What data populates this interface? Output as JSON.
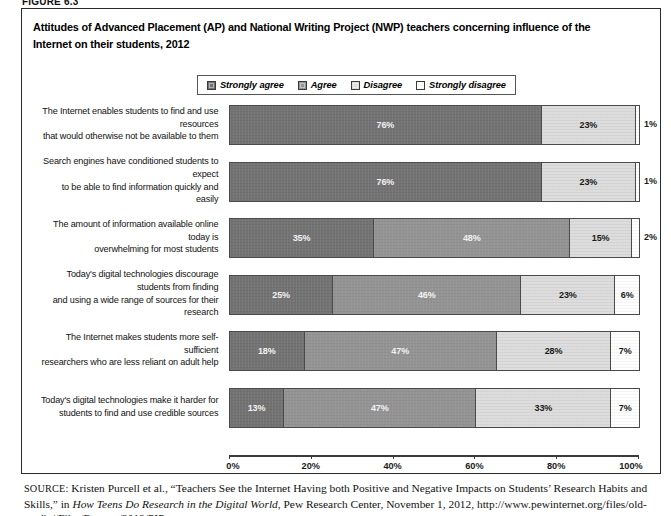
{
  "figure_label": "FIGURE 6.3",
  "title": "Attitudes of Advanced Placement (AP) and National Writing Project (NWP) teachers concerning influence of the Internet on their students, 2012",
  "legend": {
    "items": [
      {
        "label": "Strongly agree",
        "color": "#737373",
        "key": "strongly_agree"
      },
      {
        "label": "Agree",
        "color": "#949494",
        "key": "agree"
      },
      {
        "label": "Disagree",
        "color": "#dcdcdc",
        "key": "disagree"
      },
      {
        "label": "Strongly disagree",
        "color": "#ffffff",
        "key": "strongly_disagree"
      }
    ]
  },
  "axis": {
    "ticks": [
      "0%",
      "20%",
      "40%",
      "60%",
      "80%",
      "100%"
    ],
    "tick_values": [
      0,
      20,
      40,
      60,
      80,
      100
    ],
    "min": 0,
    "max": 100
  },
  "source": {
    "prefix": "SOURCE:",
    "line1_a": " Kristen Purcell et al., “Teachers See the Internet Having both Positive and Negative Impacts on Students’ Research Habits and Skills,” in ",
    "line1_italic": "How",
    "line2_italic": "Teens Do Research in the Digital World",
    "line2_b": ", Pew Research Center, November 1, 2012, http://www.pewinternet.org/files/old-media//Files/Reports/2012/PIP_"
  },
  "chart_data": {
    "type": "bar",
    "orientation": "horizontal",
    "stacked": true,
    "title": "Attitudes of Advanced Placement (AP) and National Writing Project (NWP) teachers concerning influence of the Internet on their students, 2012",
    "xlabel": "",
    "ylabel": "",
    "xlim": [
      0,
      100
    ],
    "grid": false,
    "legend_position": "top",
    "categories": [
      "The Internet enables students to find and use resources that would otherwise not be available to them",
      "Search engines have conditioned students to expect to be able to find information quickly and easily",
      "The amount of information available online today is overwhelming for most students",
      "Today's digital technologies discourage students from finding and using a wide range of sources for their research",
      "The Internet makes students more self-sufficient researchers who are less reliant on adult help",
      "Today's digital technologies make it harder for students to find and use credible sources"
    ],
    "series": [
      {
        "name": "Strongly agree",
        "values": [
          76,
          76,
          35,
          25,
          18,
          13
        ]
      },
      {
        "name": "Agree",
        "values": [
          23,
          23,
          48,
          46,
          47,
          47
        ]
      },
      {
        "name": "Disagree",
        "values": [
          0,
          0,
          15,
          23,
          28,
          33
        ]
      },
      {
        "name": "Strongly disagree",
        "values": [
          1,
          1,
          2,
          6,
          7,
          7
        ]
      }
    ]
  },
  "rows": [
    {
      "label_line1": "The Internet enables students to find and use resources",
      "label_line2": "that would otherwise not be available to them",
      "segments": [
        {
          "value": 76,
          "text": "76%",
          "style": "dark",
          "show": true
        },
        {
          "value": 23,
          "text": "23%",
          "style": "light",
          "show": true
        },
        {
          "value": 1,
          "text": "1%",
          "style": "white",
          "show": false
        }
      ],
      "outside_label": "1%"
    },
    {
      "label_line1": "Search engines have conditioned students to expect",
      "label_line2": "to be able to find information quickly and easily",
      "segments": [
        {
          "value": 76,
          "text": "76%",
          "style": "dark",
          "show": true
        },
        {
          "value": 23,
          "text": "23%",
          "style": "light",
          "show": true
        },
        {
          "value": 1,
          "text": "1%",
          "style": "white",
          "show": false
        }
      ],
      "outside_label": "1%"
    },
    {
      "label_line1": "The amount of information available online today is",
      "label_line2": "overwhelming for most students",
      "segments": [
        {
          "value": 35,
          "text": "35%",
          "style": "dark",
          "show": true
        },
        {
          "value": 48,
          "text": "48%",
          "style": "mid",
          "show": true
        },
        {
          "value": 15,
          "text": "15%",
          "style": "light",
          "show": true
        },
        {
          "value": 2,
          "text": "2%",
          "style": "white",
          "show": false
        }
      ],
      "outside_label": "2%"
    },
    {
      "label_line1": "Today's digital technologies discourage students from finding",
      "label_line2": "and using a wide range of sources for their research",
      "segments": [
        {
          "value": 25,
          "text": "25%",
          "style": "dark",
          "show": true
        },
        {
          "value": 46,
          "text": "46%",
          "style": "mid",
          "show": true
        },
        {
          "value": 23,
          "text": "23%",
          "style": "light",
          "show": true
        },
        {
          "value": 6,
          "text": "6%",
          "style": "white",
          "show": true
        }
      ],
      "outside_label": ""
    },
    {
      "label_line1": "The Internet makes students more self-sufficient",
      "label_line2": "researchers who are less reliant on adult help",
      "segments": [
        {
          "value": 18,
          "text": "18%",
          "style": "dark",
          "show": true
        },
        {
          "value": 47,
          "text": "47%",
          "style": "mid",
          "show": true
        },
        {
          "value": 28,
          "text": "28%",
          "style": "light",
          "show": true
        },
        {
          "value": 7,
          "text": "7%",
          "style": "white",
          "show": true
        }
      ],
      "outside_label": ""
    },
    {
      "label_line1": "Today's digital technologies make it harder for",
      "label_line2": "students to find and use credible sources",
      "segments": [
        {
          "value": 13,
          "text": "13%",
          "style": "dark",
          "show": true
        },
        {
          "value": 47,
          "text": "47%",
          "style": "mid",
          "show": true
        },
        {
          "value": 33,
          "text": "33%",
          "style": "light",
          "show": true
        },
        {
          "value": 7,
          "text": "7%",
          "style": "white",
          "show": true
        }
      ],
      "outside_label": ""
    }
  ]
}
